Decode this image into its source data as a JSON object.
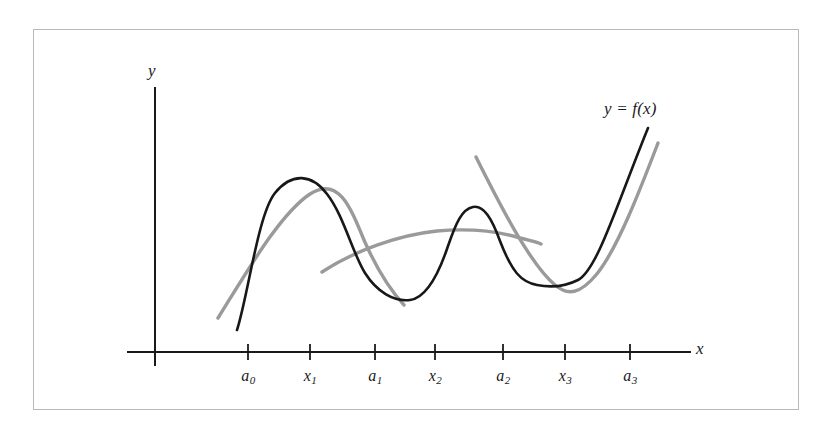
{
  "figure": {
    "kind": "mathematical-graph",
    "caption_text": "",
    "frame_color": "#b9b9b9",
    "background_color": "#ffffff"
  },
  "axes": {
    "y_axis_label": "y",
    "x_axis_label": "x",
    "origin_px": {
      "x": 155,
      "y": 352
    },
    "x_axis_span_px": {
      "start": 128,
      "end": 690
    },
    "y_axis_span_px": {
      "top": 88,
      "bottom": 365
    }
  },
  "ticks": [
    {
      "name": "a0",
      "base": "a",
      "sub": "0",
      "x_px": 248
    },
    {
      "name": "x1",
      "base": "x",
      "sub": "1",
      "x_px": 310
    },
    {
      "name": "a1",
      "base": "a",
      "sub": "1",
      "x_px": 375
    },
    {
      "name": "x2",
      "base": "x",
      "sub": "2",
      "x_px": 435
    },
    {
      "name": "a2",
      "base": "a",
      "sub": "2",
      "x_px": 503
    },
    {
      "name": "x3",
      "base": "x",
      "sub": "3",
      "x_px": 565
    },
    {
      "name": "a3",
      "base": "a",
      "sub": "3",
      "x_px": 630
    }
  ],
  "curve_label": {
    "text": "y = f(x)",
    "x_px": 604,
    "y_px": 106
  },
  "chart_data": {
    "type": "line",
    "title": "",
    "xlabel": "x",
    "ylabel": "y",
    "grid": false,
    "legend": "none",
    "annotations": [
      "y = f(x)"
    ],
    "xtick_labels": [
      "a0",
      "x1",
      "a1",
      "x2",
      "a2",
      "x3",
      "a3"
    ],
    "xtick_positions_px": [
      248,
      310,
      375,
      435,
      503,
      565,
      630
    ],
    "series": [
      {
        "name": "f(x)",
        "role": "true-function",
        "color": "#17181a",
        "path": "M 237 330 C 248 296 258 214 275 193 C 292 172 312 174 327 194 C 344 216 352 252 365 273 C 377 292 394 302 410 300 C 426 298 438 276 448 246 C 456 223 462 209 473 207 C 484 205 492 219 500 241 C 512 272 521 282 537 285 C 552 288 564 287 578 280 C 597 270 616 207 648 128"
      },
      {
        "name": "p1",
        "role": "quadratic-approximation-interval-1",
        "color": "#9a9a9a",
        "interval": [
          "a0",
          "a1"
        ],
        "node": "x1",
        "path": "M 218 318 C 248 270 280 214 310 194 C 338 176 350 206 364 240 C 378 272 392 292 404 305"
      },
      {
        "name": "p2",
        "role": "quadratic-approximation-interval-2",
        "color": "#9a9a9a",
        "interval": [
          "a1",
          "a2"
        ],
        "node": "x2",
        "path": "M 322 272 C 354 251 398 235 437 231 C 470 228 500 232 520 238 C 531 241 537 242 541 244"
      },
      {
        "name": "p3",
        "role": "quadratic-approximation-interval-3",
        "color": "#9a9a9a",
        "interval": [
          "a2",
          "a3"
        ],
        "node": "x3",
        "path": "M 476 157 C 500 205 530 264 555 285 C 568 296 580 294 596 275 C 617 250 640 190 658 143"
      }
    ]
  }
}
